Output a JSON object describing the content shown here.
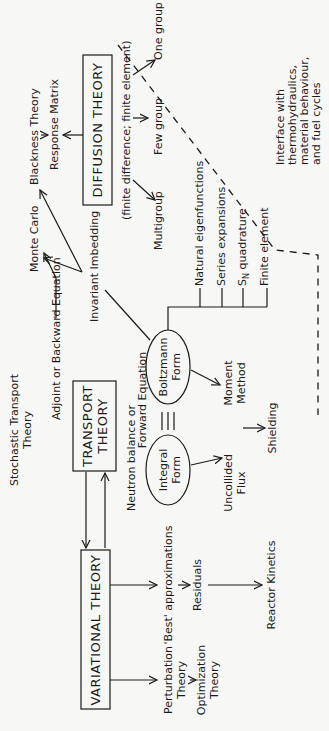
{
  "diagram": {
    "orientation": "rotated 90° counter-clockwise",
    "boxes": {
      "variational": "VARIATIONAL THEORY",
      "transport_1": "TRANSPORT",
      "transport_2": "THEORY",
      "diffusion": "DIFFUSION THEORY"
    },
    "ellipses": {
      "integral_1": "Integral",
      "integral_2": "Form",
      "boltzmann_1": "Boltzmann",
      "boltzmann_2": "Form"
    },
    "labels": {
      "stochastic_1": "Stochastic Transport",
      "stochastic_2": "Theory",
      "adjoint": "Adjoint or Backward Equation",
      "neutron_1": "Neutron balance or",
      "neutron_2": "Forward Equation",
      "invariant": "Invariant Imbedding",
      "monte_carlo": "Monte Carlo",
      "blackness": "Blackness Theory",
      "response": "Response Matrix",
      "finite_diff": "(finite difference; finite element)",
      "multigroup": "Multigroup",
      "few_group": "Few group",
      "one_group": "One group",
      "natural": "Natural eigenfunctions",
      "series": "Series expansions",
      "sn": "S",
      "sn_sub": "N",
      "sn_rest": " quadrature",
      "finite_element": "Finite element",
      "moment_1": "Moment",
      "moment_2": "Method",
      "uncollided_1": "Uncollided",
      "uncollided_2": "Flux",
      "shielding": "Shielding",
      "best": "'Best' approximations",
      "residuals": "Residuals",
      "reactor": "Reactor Kinetics",
      "perturbation_1": "Perturbation",
      "perturbation_2": "Theory",
      "optimization_1": "Optimization",
      "optimization_2": "Theory",
      "interface_1": "Interface with",
      "interface_2": "thermohydraulics,",
      "interface_3": "material behaviour,",
      "interface_4": "and fuel cycles",
      "equiv": "≡"
    }
  }
}
